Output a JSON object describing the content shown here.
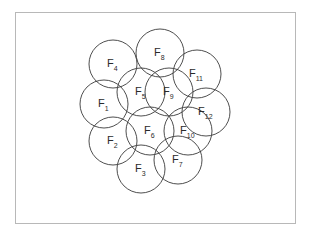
{
  "diagram": {
    "type": "overlapping-circles",
    "frame": {
      "x": 15,
      "y": 12,
      "width": 280,
      "height": 211,
      "stroke": "#b8b8b8"
    },
    "circle_radius": 24,
    "stroke_color": "#3a3a3a",
    "cells": [
      {
        "label": "F",
        "sub": "1",
        "cx": 104,
        "cy": 104
      },
      {
        "label": "F",
        "sub": "2",
        "cx": 113,
        "cy": 141
      },
      {
        "label": "F",
        "sub": "3",
        "cx": 141,
        "cy": 169
      },
      {
        "label": "F",
        "sub": "4",
        "cx": 113,
        "cy": 64
      },
      {
        "label": "F",
        "sub": "5",
        "cx": 141,
        "cy": 92
      },
      {
        "label": "F",
        "sub": "6",
        "cx": 150,
        "cy": 131
      },
      {
        "label": "F",
        "sub": "7",
        "cx": 178,
        "cy": 160
      },
      {
        "label": "F",
        "sub": "8",
        "cx": 160,
        "cy": 53
      },
      {
        "label": "F",
        "sub": "9",
        "cx": 169,
        "cy": 92
      },
      {
        "label": "F",
        "sub": "10",
        "cx": 188,
        "cy": 131
      },
      {
        "label": "F",
        "sub": "11",
        "cx": 197,
        "cy": 74
      },
      {
        "label": "F",
        "sub": "12",
        "cx": 206,
        "cy": 112
      }
    ]
  }
}
